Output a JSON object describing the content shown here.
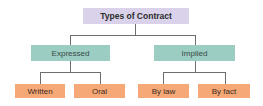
{
  "diagram": {
    "type": "tree",
    "root": {
      "label": "Types of Contract",
      "color": "#d9d2ea"
    },
    "branches": [
      {
        "label": "Expressed",
        "color": "#9bcdc2",
        "children": [
          {
            "label": "Written",
            "color": "#f7a877"
          },
          {
            "label": "Oral",
            "color": "#f7a877"
          }
        ]
      },
      {
        "label": "Implied",
        "color": "#9bcdc2",
        "children": [
          {
            "label": "By law",
            "color": "#f7a877"
          },
          {
            "label": "By fact",
            "color": "#f7a877"
          }
        ]
      }
    ],
    "connector_color": "#6e6e6e"
  }
}
